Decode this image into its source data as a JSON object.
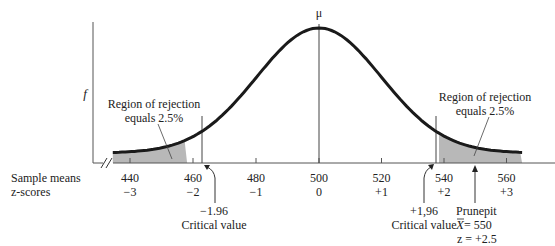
{
  "chart_data": {
    "type": "area",
    "title": "",
    "distribution": "normal",
    "mean_label": "μ",
    "ylabel": "f",
    "axis_rows": [
      {
        "label": "Sample means",
        "ticks": [
          "440",
          "460",
          "480",
          "500",
          "520",
          "540",
          "560"
        ]
      },
      {
        "label": "z-scores",
        "ticks": [
          "−3",
          "−2",
          "−1",
          "0",
          "+1",
          "+2",
          "+3"
        ]
      }
    ],
    "x_values": [
      440,
      460,
      480,
      500,
      520,
      540,
      560
    ],
    "z_values": [
      -3,
      -2,
      -1,
      0,
      1,
      2,
      3
    ],
    "mean": 500,
    "sd": 20,
    "rejection_regions": [
      {
        "side": "left",
        "label_line1": "Region of rejection",
        "label_line2": "equals 2.5%",
        "boundary_z": -1.96
      },
      {
        "side": "right",
        "label_line1": "Region of rejection",
        "label_line2": "equals 2.5%",
        "boundary_z": 1.96
      }
    ],
    "annotations": {
      "left_critical": {
        "value": "−1.96",
        "label": "Critical value"
      },
      "right_critical": {
        "value": "+1,96",
        "label": "Critical value"
      },
      "sample": {
        "name": "Prunepit",
        "xbar_symbol": "X",
        "xbar_eq": " = 550",
        "z_line": "z = +2.5"
      }
    },
    "colors": {
      "curve": "#1a1a1a",
      "shade": "#b8b8b8",
      "axis": "#555555"
    }
  }
}
